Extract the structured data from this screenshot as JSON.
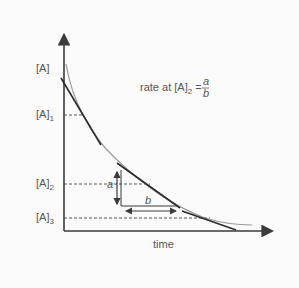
{
  "diagram": {
    "type": "concentration-time curve with tangents",
    "y_axis_label": "[A]",
    "x_axis_label": "time",
    "y_ticks": [
      {
        "base": "[A]",
        "sub": "1"
      },
      {
        "base": "[A]",
        "sub": "2"
      },
      {
        "base": "[A]",
        "sub": "3"
      }
    ],
    "annotation": {
      "prefix": "rate at [A]",
      "sub": "2",
      "equals": " = ",
      "numerator": "a",
      "denominator": "b"
    },
    "triangle_labels": {
      "vertical": "a",
      "horizontal": "b"
    },
    "colors": {
      "axis": "#3a3a3a",
      "curve": "#9a9a9a",
      "tangent": "#2b2b2b",
      "dashed": "#555555",
      "text": "#555555"
    }
  }
}
